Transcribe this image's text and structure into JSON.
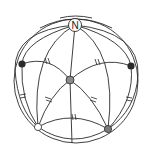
{
  "diagram": {
    "type": "spherical geometry figure",
    "north_pole_label": "N",
    "points": [
      {
        "name": "north-pole",
        "fill": "#ffffff",
        "label": "N"
      },
      {
        "name": "center-point",
        "fill": "#8a8a8a"
      },
      {
        "name": "left-point",
        "fill": "#2a2a2a"
      },
      {
        "name": "right-point",
        "fill": "#2a2a2a"
      },
      {
        "name": "bottom-left-point",
        "fill": "#ffffff"
      },
      {
        "name": "bottom-right-point",
        "fill": "#7a7a7a"
      }
    ],
    "equal_segment_marks": "double hash marks on six arcs"
  }
}
